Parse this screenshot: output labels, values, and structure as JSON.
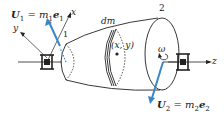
{
  "diagram": {
    "type": "rotor-unbalance-schematic",
    "colors": {
      "line": "#222222",
      "vector": "#3a86c8",
      "background": "#ffffff"
    },
    "labels": {
      "u1_vec": "U",
      "u1_sub": "1",
      "u1_eq": " = m",
      "u1_msub": "1",
      "u1_e": "e",
      "u1_esub": "1",
      "u2_vec": "U",
      "u2_sub": "2",
      "u2_eq": " = m",
      "u2_msub": "2",
      "u2_e": "e",
      "u2_esub": "2",
      "axis_x": "x",
      "axis_y": "y",
      "axis_z": "z",
      "plane1": "1",
      "plane2": "2",
      "dm": "dm",
      "point": "(x, y)",
      "omega": "ω"
    }
  }
}
